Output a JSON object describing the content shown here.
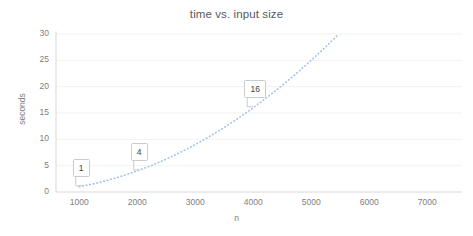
{
  "chart_data": {
    "type": "line",
    "title": "time vs. input size",
    "xlabel": "n",
    "ylabel": "seconds",
    "xlim": [
      600,
      7600
    ],
    "ylim": [
      0,
      30
    ],
    "xticks": [
      1000,
      2000,
      3000,
      4000,
      5000,
      6000,
      7000
    ],
    "xtick_labels": [
      "1000",
      "2000",
      "3000",
      "4000",
      "5000",
      "6000",
      "7000"
    ],
    "yticks": [
      0,
      5,
      10,
      15,
      20,
      25,
      30
    ],
    "ytick_labels": [
      "0",
      "5",
      "10",
      "15",
      "20",
      "25",
      "30"
    ],
    "grid": "horizontal",
    "legend": "none",
    "series": [
      {
        "name": "time",
        "style": "dotted",
        "color": "#9dc3e6",
        "marker": "none",
        "x": [
          1000,
          1250,
          1500,
          1750,
          2000,
          2250,
          2500,
          2750,
          3000,
          3250,
          3500,
          3750,
          4000,
          4250,
          4500,
          4750,
          5000,
          5250,
          5477
        ],
        "values": [
          1,
          1.56,
          2.25,
          3.06,
          4,
          5.06,
          6.25,
          7.56,
          9,
          10.56,
          12.25,
          14.06,
          16,
          18.06,
          20.25,
          22.56,
          25,
          27.56,
          30
        ]
      }
    ],
    "data_labels": [
      {
        "text": "1",
        "x": 1000,
        "y": 1
      },
      {
        "text": "4",
        "x": 2000,
        "y": 4
      },
      {
        "text": "16",
        "x": 4000,
        "y": 16
      }
    ],
    "colors": {
      "series": "#9dc3e6",
      "gridline": "#f2f2f2",
      "axis": "#d9d9d9",
      "text": "#808080",
      "title": "#595959",
      "callout_border": "#c9ccce",
      "background": "#ffffff"
    }
  }
}
